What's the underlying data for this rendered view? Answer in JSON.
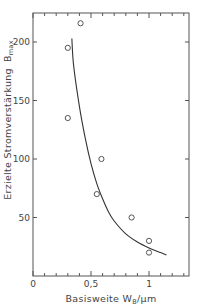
{
  "chart_data": {
    "type": "scatter",
    "title": "",
    "xlabel": "Basisweite W_B / µm",
    "xlabel_main": "Basisweite W",
    "xlabel_sub": "B",
    "xlabel_unit": "/µm",
    "ylabel": "Erzielte Stromverstärkung B_max",
    "ylabel_main": "Erzielte Stromverstärkung",
    "ylabel_symbol": "B",
    "ylabel_sub": "max",
    "xlim": [
      0,
      1.35
    ],
    "ylim": [
      0,
      225
    ],
    "x_ticks": [
      0,
      0.5,
      1
    ],
    "x_tick_labels": [
      "0",
      "0,5",
      "1"
    ],
    "x_minor_step": 0.1,
    "y_ticks": [
      50,
      100,
      150,
      200
    ],
    "y_tick_labels": [
      "50",
      "100",
      "150",
      "200"
    ],
    "grid": false,
    "legend": null,
    "series": [
      {
        "name": "Messwerte",
        "type": "scatter",
        "marker": "open-circle",
        "x": [
          0.41,
          0.3,
          0.3,
          0.59,
          0.55,
          0.85,
          1.0,
          1.0
        ],
        "y": [
          216,
          195,
          135,
          100,
          70,
          50,
          30,
          20
        ]
      },
      {
        "name": "Ausgleichskurve",
        "type": "line",
        "x": [
          0.335,
          0.35,
          0.4,
          0.45,
          0.5,
          0.55,
          0.6,
          0.65,
          0.7,
          0.8,
          0.9,
          1.0,
          1.1,
          1.15
        ],
        "y": [
          203,
          180,
          145,
          118,
          96,
          79,
          66,
          55,
          47,
          36,
          29,
          24,
          20,
          18
        ]
      }
    ]
  }
}
